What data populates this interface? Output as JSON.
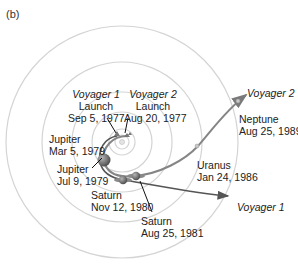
{
  "panel_label": "(b)",
  "colors": {
    "orbit": "#d2d2d2",
    "voyager1_path": "#555555",
    "voyager2_path": "#7a7a7a",
    "planet": "#6b6b6b",
    "text": "#222222"
  },
  "launches": [
    {
      "craft": "Voyager 1",
      "event": "Launch",
      "date": "Sep 5, 1977"
    },
    {
      "craft": "Voyager 2",
      "event": "Launch",
      "date": "Aug 20, 1977"
    }
  ],
  "encounters": [
    {
      "planet": "Jupiter",
      "date": "Mar 5, 1979"
    },
    {
      "planet": "Jupiter",
      "date": "Jul 9, 1979"
    },
    {
      "planet": "Saturn",
      "date": "Nov 12, 1980"
    },
    {
      "planet": "Saturn",
      "date": "Aug 25, 1981"
    },
    {
      "planet": "Uranus",
      "date": "Jan 24, 1986"
    },
    {
      "planet": "Neptune",
      "date": "Aug 25, 1989"
    }
  ],
  "trajectory_labels": {
    "voyager1": "Voyager 1",
    "voyager2": "Voyager 2"
  }
}
